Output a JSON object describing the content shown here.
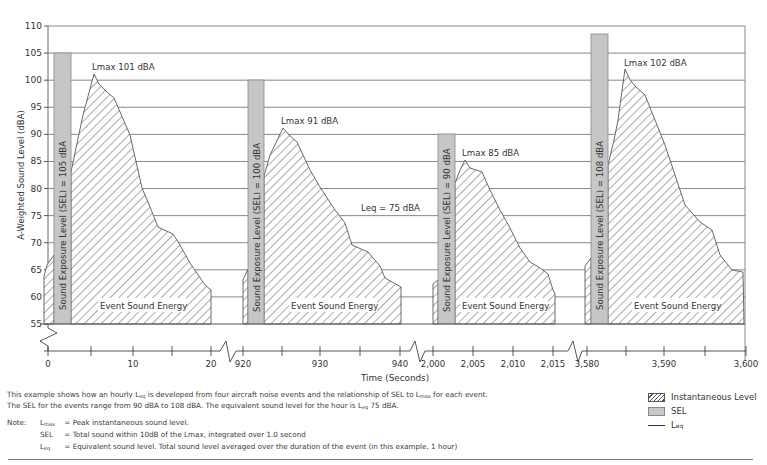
{
  "chart_data": {
    "type": "area",
    "title": "",
    "ylabel": "A-Weighted Sound Level (dBA)",
    "xlabel": "Time (Seconds)",
    "ylim": [
      55,
      110
    ],
    "yticks": [
      55,
      60,
      65,
      70,
      75,
      80,
      85,
      90,
      95,
      100,
      105,
      110
    ],
    "grid": true,
    "x_segments": [
      {
        "ticks": [
          "0",
          "10",
          "20"
        ]
      },
      {
        "ticks": [
          "920",
          "930",
          "940"
        ]
      },
      {
        "ticks": [
          "2,000",
          "2,005",
          "2,010",
          "2,015"
        ]
      },
      {
        "ticks": [
          "3,580",
          "3,590",
          "3,600"
        ]
      }
    ],
    "leq": {
      "value": 75,
      "label": "Leq = 75 dBA"
    },
    "events": [
      {
        "lmax": 101,
        "lmax_label": "Lmax 101 dBA",
        "sel": 105,
        "sel_label": "Sound Exposure Level (SEL) = 105 dBA",
        "energy_label": "Event Sound Energy"
      },
      {
        "lmax": 91,
        "lmax_label": "Lmax 91 dBA",
        "sel": 100,
        "sel_label": "Sound Exposure Level (SEL) = 100 dBA",
        "energy_label": "Event Sound Energy"
      },
      {
        "lmax": 85,
        "lmax_label": "Lmax 85 dBA",
        "sel": 90,
        "sel_label": "Sound Exposure Level (SEL) = 90 dBA",
        "energy_label": "Event Sound Energy"
      },
      {
        "lmax": 102,
        "lmax_label": "Lmax 102 dBA",
        "sel": 108,
        "sel_label": "Sound Exposure Level (SEL) = 108 dBA",
        "energy_label": "Event Sound Energy"
      }
    ],
    "legend": [
      "Instantaneous Level",
      "SEL",
      "Leq"
    ]
  },
  "caption": {
    "line1_a": "This example shows how an hourly L",
    "line1_sub1": "eq",
    "line1_b": " is developed from four aircraft noise events and the relationship of SEL to L",
    "line1_sub2": "max",
    "line1_c": " for each event.",
    "line2_a": "The SEL for the events range from 90 dBA to 108 dBA. The equivalent sound level for the hour is L",
    "line2_sub": "eq",
    "line2_b": " 75 dBA."
  },
  "notes": {
    "label": "Note:",
    "rows": [
      {
        "term": "L",
        "term_sub": "max",
        "eq": "=",
        "def": "Peak instantaneous sound level."
      },
      {
        "term": "SEL",
        "term_sub": "",
        "eq": "=",
        "def": "Total sound within 10dB of the Lmax, integrated over 1.0 second"
      },
      {
        "term": "L",
        "term_sub": "eq",
        "eq": "=",
        "def": "Equivalent sound level. Total sound level averaged over the duration of the event (in this example, 1 hour)"
      }
    ]
  },
  "legend": {
    "items": [
      {
        "label": "Instantaneous Level",
        "sub": ""
      },
      {
        "label": "SEL",
        "sub": ""
      },
      {
        "label": "L",
        "sub": "eq"
      }
    ]
  }
}
